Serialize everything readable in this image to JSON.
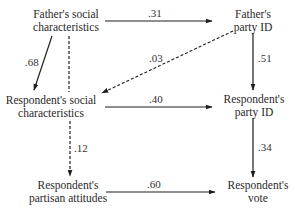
{
  "diagram": {
    "type": "path-diagram",
    "nodes": {
      "father_social": {
        "line1": "Father's social",
        "line2": "characteristics"
      },
      "father_party": {
        "line1": "Father's",
        "line2": "party ID"
      },
      "resp_social": {
        "line1": "Respondent's social",
        "line2": "characteristics"
      },
      "resp_party": {
        "line1": "Respondent's",
        "line2": "party ID"
      },
      "resp_attitudes": {
        "line1": "Respondent's",
        "line2": "partisan attitudes"
      },
      "resp_vote": {
        "line1": "Respondent's",
        "line2": "vote"
      }
    },
    "edges": [
      {
        "from": "father_social",
        "to": "father_party",
        "style": "solid",
        "coefficient": ".31"
      },
      {
        "from": "father_social",
        "to": "resp_social",
        "style": "solid",
        "coefficient": ".68"
      },
      {
        "from": "father_social",
        "to": "resp_attitudes",
        "style": "dashed",
        "coefficient": ""
      },
      {
        "from": "father_party",
        "to": "resp_social",
        "style": "dashed",
        "coefficient": ".03"
      },
      {
        "from": "father_party",
        "to": "resp_party",
        "style": "solid",
        "coefficient": ".51"
      },
      {
        "from": "resp_social",
        "to": "resp_party",
        "style": "solid",
        "coefficient": ".40"
      },
      {
        "from": "resp_social",
        "to": "resp_attitudes",
        "style": "dashed",
        "coefficient": ".12"
      },
      {
        "from": "resp_party",
        "to": "resp_vote",
        "style": "solid",
        "coefficient": ".34"
      },
      {
        "from": "resp_attitudes",
        "to": "resp_vote",
        "style": "solid",
        "coefficient": ".60"
      }
    ],
    "colors": {
      "line": "#1e1e1e",
      "text": "#2a2a2a",
      "background": "#ffffff"
    }
  }
}
